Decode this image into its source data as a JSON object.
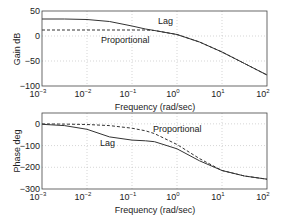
{
  "chart_data": [
    {
      "type": "line",
      "title": "",
      "xlabel": "Frequency (rad/sec)",
      "ylabel": "Gain dB",
      "xscale": "log",
      "xlim": [
        0.001,
        100
      ],
      "ylim": [
        -100,
        50
      ],
      "yticks": [
        50,
        0,
        -50,
        -100
      ],
      "xticks": [
        "10^-3",
        "10^-2",
        "10^-1",
        "10^0",
        "10^1",
        "10^2"
      ],
      "grid": true,
      "x_log10": [
        -3,
        -2.5,
        -2,
        -1.5,
        -1,
        -0.7,
        -0.5,
        0,
        0.5,
        1,
        1.5,
        2
      ],
      "series": [
        {
          "name": "Lag",
          "style": "solid",
          "values": [
            34,
            34,
            33,
            29,
            20,
            14,
            11,
            3,
            -12,
            -32,
            -55,
            -78
          ]
        },
        {
          "name": "Proportional",
          "style": "dashed",
          "values": [
            12,
            12,
            12,
            12,
            12,
            12,
            11,
            3,
            -12,
            -32,
            -55,
            -78
          ]
        }
      ],
      "annotations": [
        {
          "text": "Lag",
          "x_log10": -1.2,
          "y": 40
        },
        {
          "text": "Proportional",
          "x_log10": -1.5,
          "y": -2
        }
      ]
    },
    {
      "type": "line",
      "title": "",
      "xlabel": "Frequency (rad/sec)",
      "ylabel": "Phase deg",
      "xscale": "log",
      "xlim": [
        0.001,
        100
      ],
      "ylim": [
        -300,
        50
      ],
      "yticks": [
        0,
        -100,
        -200,
        -300
      ],
      "xticks": [
        "10^-3",
        "10^-2",
        "10^-1",
        "10^0",
        "10^1",
        "10^2"
      ],
      "grid": true,
      "x_log10": [
        -3,
        -2.5,
        -2,
        -1.5,
        -1,
        -0.7,
        -0.5,
        0,
        0.5,
        1,
        1.5,
        2
      ],
      "series": [
        {
          "name": "Lag",
          "style": "solid",
          "values": [
            -2,
            -8,
            -25,
            -60,
            -75,
            -78,
            -82,
            -115,
            -170,
            -215,
            -240,
            -255
          ]
        },
        {
          "name": "Proportional",
          "style": "dashed",
          "values": [
            0,
            -1,
            -3,
            -8,
            -20,
            -32,
            -45,
            -95,
            -160,
            -215,
            -240,
            -255
          ]
        }
      ],
      "annotations": [
        {
          "text": "Lag",
          "x_log10": -1.7,
          "y": -95
        },
        {
          "text": "Proportional",
          "x_log10": -0.3,
          "y": -25
        }
      ]
    }
  ],
  "labels": {
    "gain_ylabel": "Gain dB",
    "phase_ylabel": "Phase deg",
    "xlabel": "Frequency (rad/sec)",
    "gain_yticks": [
      "50",
      "0",
      "−50",
      "−100"
    ],
    "phase_yticks": [
      "0",
      "−100",
      "−200",
      "−300"
    ],
    "xtick_base": "10",
    "xtick_exps": [
      "−3",
      "−2",
      "−1",
      "0",
      "1",
      "2"
    ],
    "lag": "Lag",
    "proportional": "Proportional"
  }
}
